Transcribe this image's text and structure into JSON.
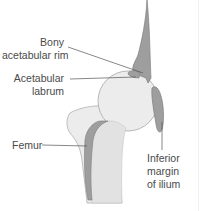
{
  "labels": {
    "bony_rim": {
      "line1": "Bony",
      "line2": "acetabular rim"
    },
    "labrum": {
      "line1": "Acetabular",
      "line2": "labrum"
    },
    "femur": {
      "line1": "Femur"
    },
    "inferior_ilium": {
      "line1": "Inferior",
      "line2": "margin",
      "line3": "of ilium"
    }
  },
  "colors": {
    "bone_dark": "#9e9e9e",
    "bone_dark_outline": "#7d7d7d",
    "bone_light": "#ececec",
    "bone_light_outline": "#b0b0b0",
    "leader_line": "#555555",
    "text": "#4a4a4a"
  }
}
